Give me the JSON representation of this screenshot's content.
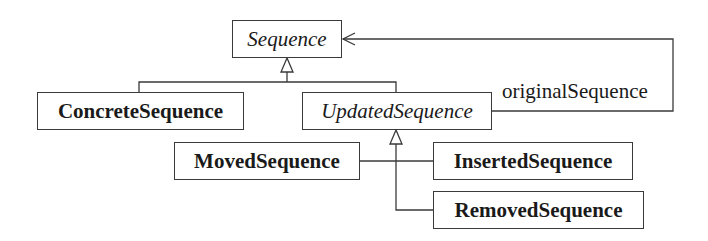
{
  "diagram": {
    "type": "UML class diagram",
    "classes": [
      {
        "id": "sequence",
        "name": "Sequence",
        "abstract": true,
        "x": 232,
        "y": 20,
        "w": 110,
        "h": 38
      },
      {
        "id": "concrete_sequence",
        "name": "ConcreteSequence",
        "abstract": false,
        "x": 37,
        "y": 92,
        "w": 207,
        "h": 38
      },
      {
        "id": "updated_sequence",
        "name": "UpdatedSequence",
        "abstract": true,
        "x": 302,
        "y": 92,
        "w": 190,
        "h": 38
      },
      {
        "id": "moved_sequence",
        "name": "MovedSequence",
        "abstract": false,
        "x": 174,
        "y": 142,
        "w": 186,
        "h": 38
      },
      {
        "id": "inserted_sequence",
        "name": "InsertedSequence",
        "abstract": false,
        "x": 433,
        "y": 142,
        "w": 200,
        "h": 38
      },
      {
        "id": "removed_sequence",
        "name": "RemovedSequence",
        "abstract": false,
        "x": 433,
        "y": 191,
        "w": 211,
        "h": 38
      }
    ],
    "relationships": [
      {
        "type": "generalization",
        "from": "ConcreteSequence",
        "to": "Sequence"
      },
      {
        "type": "generalization",
        "from": "UpdatedSequence",
        "to": "Sequence"
      },
      {
        "type": "generalization",
        "from": "MovedSequence",
        "to": "UpdatedSequence"
      },
      {
        "type": "generalization",
        "from": "InsertedSequence",
        "to": "UpdatedSequence"
      },
      {
        "type": "generalization",
        "from": "RemovedSequence",
        "to": "UpdatedSequence"
      },
      {
        "type": "association",
        "from": "UpdatedSequence",
        "to": "Sequence",
        "navigable": true,
        "label": "originalSequence"
      }
    ],
    "labels": {
      "association_original": "originalSequence"
    },
    "colors": {
      "line": "#3a3a3a",
      "text": "#1a1a1a",
      "background": "#ffffff"
    }
  }
}
